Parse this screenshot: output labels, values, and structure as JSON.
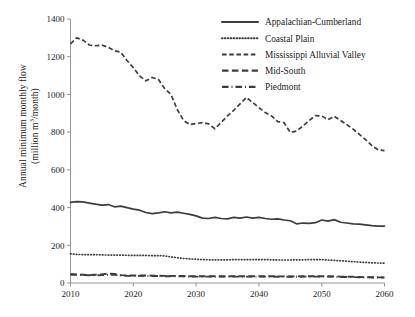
{
  "chart_data": {
    "type": "line",
    "title": "",
    "xlabel": "",
    "ylabel": "Annual minimum monthly flow (million m³/month)",
    "ylabel_line1": "Annual minimum monthly flow",
    "ylabel_line2": "(million m3/month)",
    "ylabel_unit_sup": "3",
    "xlim": [
      2010,
      2060
    ],
    "ylim": [
      0,
      1400
    ],
    "xticks": [
      2010,
      2020,
      2030,
      2040,
      2050,
      2060
    ],
    "xtick_labels": [
      "2010",
      "2020",
      "2030",
      "2040",
      "2050",
      "2060"
    ],
    "yticks": [
      0,
      200,
      400,
      600,
      800,
      1000,
      1200,
      1400
    ],
    "ytick_labels": [
      "0",
      "200",
      "400",
      "600",
      "800",
      "1000",
      "1200",
      "1400"
    ],
    "grid": false,
    "legend_position": "top-right",
    "x": [
      2010,
      2011,
      2012,
      2013,
      2014,
      2015,
      2016,
      2017,
      2018,
      2019,
      2020,
      2021,
      2022,
      2023,
      2024,
      2025,
      2026,
      2027,
      2028,
      2029,
      2030,
      2031,
      2032,
      2033,
      2034,
      2035,
      2036,
      2037,
      2038,
      2039,
      2040,
      2041,
      2042,
      2043,
      2044,
      2045,
      2046,
      2047,
      2048,
      2049,
      2050,
      2051,
      2052,
      2053,
      2054,
      2055,
      2056,
      2057,
      2058,
      2059,
      2060
    ],
    "series": [
      {
        "name": "Appalachian-Cumberland",
        "style": "solid",
        "color": "#3d3d3d",
        "values": [
          428,
          432,
          430,
          424,
          418,
          413,
          416,
          404,
          408,
          400,
          392,
          386,
          374,
          368,
          372,
          378,
          372,
          376,
          370,
          364,
          356,
          344,
          342,
          348,
          342,
          340,
          348,
          344,
          350,
          344,
          348,
          342,
          338,
          340,
          334,
          330,
          314,
          318,
          316,
          320,
          334,
          328,
          336,
          322,
          318,
          314,
          312,
          308,
          304,
          302,
          302
        ]
      },
      {
        "name": "Coastal Plain",
        "style": "dotted",
        "color": "#3d3d3d",
        "values": [
          155,
          152,
          150,
          150,
          150,
          149,
          148,
          148,
          148,
          147,
          146,
          146,
          146,
          145,
          145,
          144,
          138,
          134,
          130,
          128,
          126,
          124,
          123,
          123,
          123,
          123,
          124,
          124,
          124,
          124,
          124,
          124,
          123,
          122,
          122,
          122,
          123,
          123,
          124,
          124,
          124,
          122,
          120,
          118,
          116,
          113,
          111,
          109,
          107,
          106,
          105
        ]
      },
      {
        "name": "Mississippi Alluvial Valley",
        "style": "dashed",
        "color": "#3d3d3d",
        "values": [
          1268,
          1300,
          1288,
          1262,
          1258,
          1262,
          1250,
          1232,
          1224,
          1180,
          1142,
          1098,
          1072,
          1090,
          1080,
          1030,
          1000,
          920,
          862,
          840,
          846,
          850,
          844,
          818,
          852,
          886,
          916,
          950,
          984,
          958,
          930,
          904,
          886,
          856,
          850,
          798,
          806,
          832,
          862,
          888,
          886,
          866,
          884,
          862,
          840,
          816,
          788,
          760,
          728,
          706,
          702
        ]
      },
      {
        "name": "Mid-South",
        "style": "dash-long",
        "color": "#3d3d3d",
        "values": [
          48,
          46,
          44,
          42,
          44,
          46,
          50,
          48,
          42,
          40,
          40,
          40,
          40,
          39,
          39,
          38,
          38,
          37,
          37,
          36,
          36,
          36,
          36,
          36,
          36,
          36,
          36,
          36,
          36,
          36,
          36,
          36,
          36,
          35,
          35,
          35,
          35,
          36,
          36,
          36,
          36,
          36,
          35,
          34,
          34,
          33,
          32,
          31,
          31,
          30,
          30
        ]
      },
      {
        "name": "Piedmont",
        "style": "dash-dot",
        "color": "#3d3d3d",
        "values": [
          44,
          43,
          42,
          41,
          41,
          42,
          44,
          43,
          40,
          38,
          38,
          38,
          38,
          37,
          37,
          36,
          36,
          35,
          35,
          34,
          34,
          34,
          34,
          34,
          34,
          34,
          34,
          34,
          34,
          34,
          34,
          34,
          34,
          33,
          33,
          33,
          33,
          34,
          34,
          34,
          34,
          34,
          33,
          32,
          32,
          31,
          30,
          30,
          29,
          29,
          29
        ]
      }
    ]
  },
  "legend": {
    "items": [
      {
        "label": "Appalachian-Cumberland",
        "style": "solid"
      },
      {
        "label": "Coastal Plain",
        "style": "dotted"
      },
      {
        "label": "Mississippi Alluvial Valley",
        "style": "dashed"
      },
      {
        "label": "Mid-South",
        "style": "dash-long"
      },
      {
        "label": "Piedmont",
        "style": "dash-dot"
      }
    ]
  }
}
